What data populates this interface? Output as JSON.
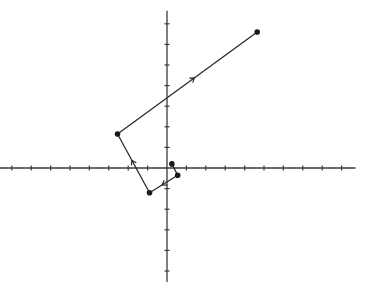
{
  "diagram": {
    "type": "vector-path-on-cartesian-plane",
    "colors": {
      "axis": "#3a3a3a",
      "path": "#2a2a2a",
      "point": "#1a1a1a",
      "arrow": "#2a2a2a"
    },
    "axes": {
      "x": {
        "ticks_negative": 9,
        "ticks_positive": 9
      },
      "y": {
        "ticks_positive": 7,
        "ticks_negative": 5
      }
    },
    "path_points": [
      {
        "label": "P0",
        "x": 0.25,
        "y": 0.2
      },
      {
        "label": "P1",
        "x": 0.55,
        "y": -0.35
      },
      {
        "label": "P2",
        "x": -0.9,
        "y": -1.2
      },
      {
        "label": "P3",
        "x": -2.55,
        "y": 1.65
      },
      {
        "label": "P4",
        "x": 4.65,
        "y": 6.6
      }
    ],
    "segments_with_arrows": [
      {
        "from": "P1",
        "to": "P2"
      },
      {
        "from": "P2",
        "to": "P3"
      },
      {
        "from": "P3",
        "to": "P4"
      }
    ]
  },
  "caption": ""
}
